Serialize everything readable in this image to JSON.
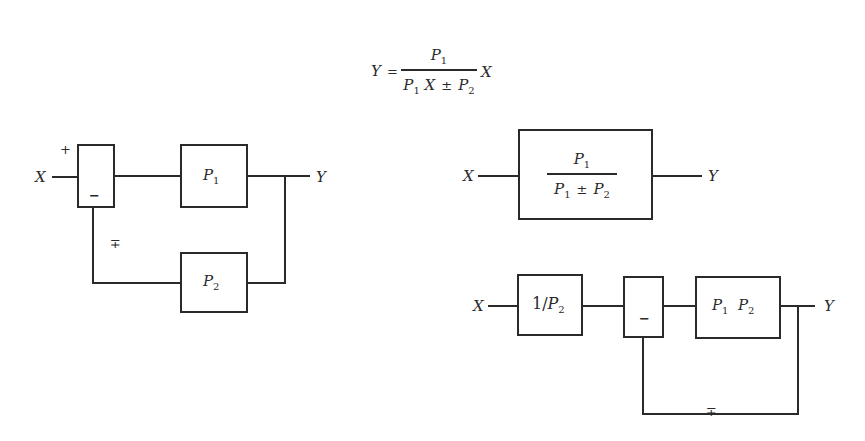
{
  "equation": {
    "lhs": "Y",
    "equals": "=",
    "numerator": {
      "var": "P",
      "sub": "1"
    },
    "denominator": [
      {
        "var": "P",
        "sub": "1"
      },
      {
        "var": "X"
      },
      {
        "op": "±"
      },
      {
        "var": "P",
        "sub": "2"
      }
    ],
    "trailing": "X"
  },
  "diagram_left": {
    "input_label": "X",
    "output_label": "Y",
    "summer": {
      "plus_sign": "+",
      "minus_sign": "−"
    },
    "feedback_sign": "∓",
    "blocks": [
      {
        "id": "p1",
        "var": "P",
        "sub": "1"
      },
      {
        "id": "p2",
        "var": "P",
        "sub": "2"
      }
    ]
  },
  "diagram_right_top": {
    "input_label": "X",
    "output_label": "Y",
    "block": {
      "numerator": {
        "var": "P",
        "sub": "1"
      },
      "denominator": {
        "left": {
          "var": "P",
          "sub": "1"
        },
        "op": "±",
        "right": {
          "var": "P",
          "sub": "2"
        }
      }
    }
  },
  "diagram_right_bottom": {
    "input_label": "X",
    "output_label": "Y",
    "blocks": [
      {
        "id": "inv-p2",
        "prefix": "1/",
        "var": "P",
        "sub": "2"
      },
      {
        "id": "p1p2",
        "a": {
          "var": "P",
          "sub": "1"
        },
        "b": {
          "var": "P",
          "sub": "2"
        }
      }
    ],
    "summer": {
      "minus_sign": "−"
    },
    "feedback_sign": "∓"
  },
  "colors": {
    "line": "#2a2a2a",
    "background": "#ffffff"
  }
}
